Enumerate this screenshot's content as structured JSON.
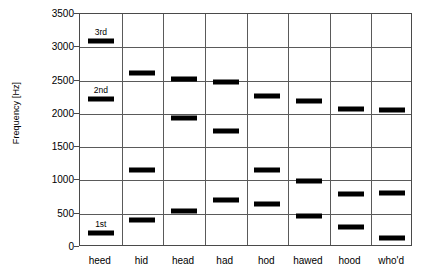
{
  "chart_data": {
    "type": "scatter",
    "title": "",
    "xlabel": "",
    "ylabel": "Frequency [Hz]",
    "ylim": [
      0,
      3500
    ],
    "ytick_values": [
      0,
      500,
      1000,
      1500,
      2000,
      2500,
      3000,
      3500
    ],
    "ytick_labels": [
      "0",
      "500",
      "1000",
      "1500",
      "2000",
      "2500",
      "3000",
      "3500"
    ],
    "grid": true,
    "legend": "none",
    "categories": [
      "heed",
      "hid",
      "head",
      "had",
      "hod",
      "hawed",
      "hood",
      "who'd"
    ],
    "series": [
      {
        "name": "1st",
        "values": [
          210,
          400,
          540,
          710,
          645,
          460,
          300,
          140
        ]
      },
      {
        "name": "2nd",
        "values": [
          2220,
          1160,
          1940,
          1740,
          1160,
          990,
          800,
          810
        ]
      },
      {
        "name": "3rd",
        "values": [
          3100,
          2620,
          2520,
          2480,
          2275,
          2200,
          2075,
          2060
        ]
      }
    ],
    "annotations": [
      {
        "text": "3rd",
        "category": "heed",
        "value": 3100
      },
      {
        "text": "2nd",
        "category": "heed",
        "value": 2220
      },
      {
        "text": "1st",
        "category": "heed",
        "value": 210
      }
    ],
    "marker_color": "#000000",
    "grid_color": "#5a5a5a",
    "axis_color": "#4a4a4a"
  }
}
